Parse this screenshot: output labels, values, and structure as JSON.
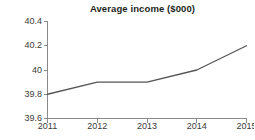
{
  "chart_data": {
    "type": "line",
    "title": "Average income ($000)",
    "xlabel": "",
    "ylabel": "",
    "categories": [
      "2011",
      "2012",
      "2013",
      "2014",
      "2015"
    ],
    "values": [
      39.8,
      39.9,
      39.9,
      40.0,
      40.2
    ],
    "series": [
      {
        "name": "Average income",
        "values": [
          39.8,
          39.9,
          39.9,
          40.0,
          40.2
        ]
      }
    ],
    "ylim": [
      39.6,
      40.4
    ],
    "ytick_values": [
      40.4,
      40.2,
      40.0,
      39.8,
      39.6
    ],
    "ytick_labels": [
      "40.4",
      "40.2",
      "40",
      "39.8",
      "39.6"
    ],
    "xtick_labels": [
      "2011",
      "2012",
      "2013",
      "2014",
      "2015"
    ],
    "grid": false,
    "legend": false,
    "legend_position": "none",
    "line_color": "#555555",
    "axis_color": "#8a8a8a",
    "text_color": "#3b3b3b",
    "background_color": "#ffffff"
  }
}
